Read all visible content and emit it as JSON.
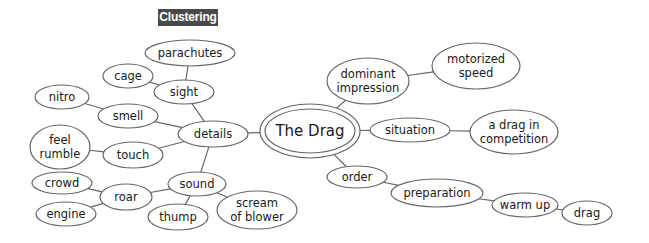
{
  "title": "Clustering",
  "colors": {
    "stroke": "#666666",
    "text": "#1a1a1a",
    "title_bg": "#4a4a4a",
    "title_fg": "#ffffff"
  },
  "center": {
    "id": "the-drag",
    "lines": [
      "The Drag"
    ],
    "cx": 310,
    "cy": 131,
    "rx": 50,
    "ry": 27
  },
  "nodes": [
    {
      "id": "details",
      "lines": [
        "details"
      ],
      "cx": 213,
      "cy": 134,
      "rx": 35,
      "ry": 13
    },
    {
      "id": "sight",
      "lines": [
        "sight"
      ],
      "cx": 184,
      "cy": 92,
      "rx": 30,
      "ry": 12
    },
    {
      "id": "parachutes",
      "lines": [
        "parachutes"
      ],
      "cx": 190,
      "cy": 53,
      "rx": 45,
      "ry": 13
    },
    {
      "id": "cage",
      "lines": [
        "cage"
      ],
      "cx": 128,
      "cy": 76,
      "rx": 25,
      "ry": 12
    },
    {
      "id": "smell",
      "lines": [
        "smell"
      ],
      "cx": 128,
      "cy": 116,
      "rx": 30,
      "ry": 12
    },
    {
      "id": "nitro",
      "lines": [
        "nitro"
      ],
      "cx": 62,
      "cy": 97,
      "rx": 27,
      "ry": 12
    },
    {
      "id": "touch",
      "lines": [
        "touch"
      ],
      "cx": 133,
      "cy": 155,
      "rx": 30,
      "ry": 13
    },
    {
      "id": "feel-rumble",
      "lines": [
        "feel",
        "rumble"
      ],
      "cx": 60,
      "cy": 147,
      "rx": 30,
      "ry": 22
    },
    {
      "id": "sound",
      "lines": [
        "sound"
      ],
      "cx": 197,
      "cy": 184,
      "rx": 29,
      "ry": 12
    },
    {
      "id": "roar",
      "lines": [
        "roar"
      ],
      "cx": 126,
      "cy": 197,
      "rx": 26,
      "ry": 13
    },
    {
      "id": "crowd",
      "lines": [
        "crowd"
      ],
      "cx": 62,
      "cy": 183,
      "rx": 30,
      "ry": 11
    },
    {
      "id": "engine",
      "lines": [
        "engine"
      ],
      "cx": 66,
      "cy": 214,
      "rx": 30,
      "ry": 12
    },
    {
      "id": "thump",
      "lines": [
        "thump"
      ],
      "cx": 178,
      "cy": 217,
      "rx": 30,
      "ry": 13
    },
    {
      "id": "scream-of-blower",
      "lines": [
        "scream",
        "of blower"
      ],
      "cx": 257,
      "cy": 210,
      "rx": 40,
      "ry": 19
    },
    {
      "id": "dominant-impression",
      "lines": [
        "dominant",
        "impression"
      ],
      "cx": 368,
      "cy": 81,
      "rx": 41,
      "ry": 23
    },
    {
      "id": "motorized-speed",
      "lines": [
        "motorized",
        "speed"
      ],
      "cx": 476,
      "cy": 66,
      "rx": 44,
      "ry": 23
    },
    {
      "id": "situation",
      "lines": [
        "situation"
      ],
      "cx": 410,
      "cy": 130,
      "rx": 40,
      "ry": 12
    },
    {
      "id": "a-drag-in-competition",
      "lines": [
        "a drag in",
        "competition"
      ],
      "cx": 514,
      "cy": 132,
      "rx": 44,
      "ry": 22
    },
    {
      "id": "order",
      "lines": [
        "order"
      ],
      "cx": 357,
      "cy": 177,
      "rx": 30,
      "ry": 11
    },
    {
      "id": "preparation",
      "lines": [
        "preparation"
      ],
      "cx": 437,
      "cy": 193,
      "rx": 46,
      "ry": 14
    },
    {
      "id": "warm-up",
      "lines": [
        "warm up"
      ],
      "cx": 525,
      "cy": 205,
      "rx": 33,
      "ry": 12
    },
    {
      "id": "drag",
      "lines": [
        "drag"
      ],
      "cx": 587,
      "cy": 213,
      "rx": 25,
      "ry": 12
    }
  ],
  "edges": [
    [
      "the-drag",
      "details"
    ],
    [
      "details",
      "sight"
    ],
    [
      "sight",
      "parachutes"
    ],
    [
      "sight",
      "cage"
    ],
    [
      "details",
      "smell"
    ],
    [
      "smell",
      "nitro"
    ],
    [
      "details",
      "touch"
    ],
    [
      "touch",
      "feel-rumble"
    ],
    [
      "details",
      "sound"
    ],
    [
      "sound",
      "roar"
    ],
    [
      "roar",
      "crowd"
    ],
    [
      "roar",
      "engine"
    ],
    [
      "sound",
      "thump"
    ],
    [
      "sound",
      "scream-of-blower"
    ],
    [
      "the-drag",
      "dominant-impression"
    ],
    [
      "dominant-impression",
      "motorized-speed"
    ],
    [
      "the-drag",
      "situation"
    ],
    [
      "situation",
      "a-drag-in-competition"
    ],
    [
      "the-drag",
      "order"
    ],
    [
      "order",
      "preparation"
    ],
    [
      "preparation",
      "warm-up"
    ],
    [
      "warm-up",
      "drag"
    ]
  ]
}
